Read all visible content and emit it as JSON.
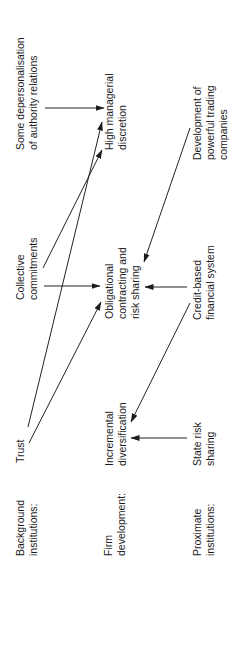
{
  "rows": {
    "background": {
      "line1": "Background",
      "line2": "institutions:"
    },
    "firm": {
      "line1": "Firm",
      "line2": "development:"
    },
    "proximate": {
      "line1": "Proximate",
      "line2": "institutions:"
    }
  },
  "nodes": {
    "trust": {
      "line1": "Trust"
    },
    "collective": {
      "line1": "Collective",
      "line2": "commitments"
    },
    "depersonalisation": {
      "line1": "Some depersonalisation",
      "line2": "of authority relations"
    },
    "incremental": {
      "line1": "Incremental",
      "line2": "diversification"
    },
    "obligational": {
      "line1": "Obligational",
      "line2": "contracting and",
      "line3": "risk sharing"
    },
    "managerial": {
      "line1": "High managerial",
      "line2": "discretion"
    },
    "state": {
      "line1": "State risk",
      "line2": "sharing"
    },
    "credit": {
      "line1": "Credit-based",
      "line2": "financial system"
    },
    "trading": {
      "line1": "Development of",
      "line2": "powerful trading",
      "line3": "companies"
    }
  },
  "edges": [
    {
      "from": "Some depersonalisation of authority relations",
      "to": "High managerial discretion"
    },
    {
      "from": "Trust",
      "to": "High managerial discretion"
    },
    {
      "from": "Trust",
      "to": "Obligational contracting and risk sharing"
    },
    {
      "from": "Collective commitments",
      "to": "High managerial discretion"
    },
    {
      "from": "Collective commitments",
      "to": "Obligational contracting and risk sharing"
    },
    {
      "from": "Development of powerful trading companies",
      "to": "Obligational contracting and risk sharing"
    },
    {
      "from": "Credit-based financial system",
      "to": "Obligational contracting and risk sharing"
    },
    {
      "from": "Credit-based financial system",
      "to": "Incremental diversification"
    },
    {
      "from": "State risk sharing",
      "to": "Incremental diversification"
    }
  ],
  "orientation": "rotated-90-ccw"
}
